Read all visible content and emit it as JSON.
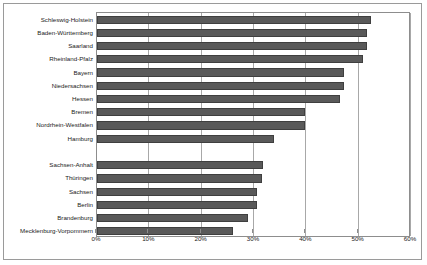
{
  "chart_data": {
    "type": "bar",
    "orientation": "horizontal",
    "title": "",
    "subtitle": "",
    "xlabel": "",
    "ylabel": "",
    "xlim": [
      0,
      60
    ],
    "xtick_labels": [
      "0%",
      "10%",
      "20%",
      "30%",
      "40%",
      "50%",
      "60%"
    ],
    "xticks": [
      0,
      10,
      20,
      30,
      40,
      50,
      60
    ],
    "grid": true,
    "legend": null,
    "value_unit": "%",
    "bar_color": "#595959",
    "bar_border_color": "#3f3f3f",
    "plot_border_color": "#8d8d8d",
    "gridline_color": "#a8a8a8",
    "frame_border_color": "#9a9a9a",
    "categories": [
      "Schleswig-Holstein",
      "Baden-Württemberg",
      "Saarland",
      "Rheinland-Pfalz",
      "Bayern",
      "Niedersachsen",
      "Hessen",
      "Bremen",
      "Nordrhein-Westfalen",
      "Hamburg",
      "",
      "Sachsen-Anhalt",
      "Thüringen",
      "Sachsen",
      "Berlin",
      "Brandenburg",
      "Mecklenburg-Vorpommern"
    ],
    "values": [
      52.4,
      51.6,
      51.6,
      50.9,
      47.2,
      47.2,
      46.4,
      39.7,
      39.7,
      33.8,
      null,
      31.8,
      31.6,
      30.6,
      30.6,
      28.9,
      25.9
    ],
    "rows": [
      {
        "label": "Schleswig-Holstein",
        "value": 52.4
      },
      {
        "label": "Baden-Württemberg",
        "value": 51.6
      },
      {
        "label": "Saarland",
        "value": 51.6
      },
      {
        "label": "Rheinland-Pfalz",
        "value": 50.9
      },
      {
        "label": "Bayern",
        "value": 47.2
      },
      {
        "label": "Niedersachsen",
        "value": 47.2
      },
      {
        "label": "Hessen",
        "value": 46.4
      },
      {
        "label": "Bremen",
        "value": 39.7
      },
      {
        "label": "Nordrhein-Westfalen",
        "value": 39.7
      },
      {
        "label": "Hamburg",
        "value": 33.8
      },
      {
        "label": "",
        "value": null
      },
      {
        "label": "Sachsen-Anhalt",
        "value": 31.8
      },
      {
        "label": "Thüringen",
        "value": 31.6
      },
      {
        "label": "Sachsen",
        "value": 30.6
      },
      {
        "label": "Berlin",
        "value": 30.6
      },
      {
        "label": "Brandenburg",
        "value": 28.9
      },
      {
        "label": "Mecklenburg-Vorpommern",
        "value": 25.9
      }
    ]
  }
}
